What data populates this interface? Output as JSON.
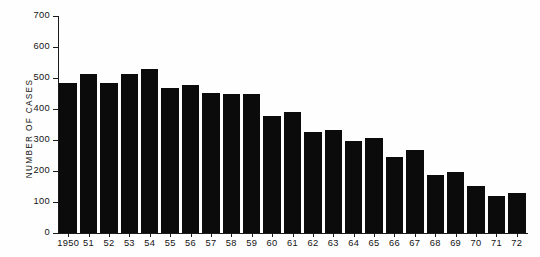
{
  "chart_data": {
    "type": "bar",
    "title": "",
    "subtitle": "",
    "xlabel": "",
    "ylabel": "NUMBER OF CASES",
    "ylim": [
      0,
      700
    ],
    "yticks": [
      0,
      100,
      200,
      300,
      400,
      500,
      600,
      700
    ],
    "ytick_labels": [
      "0",
      "100",
      "200",
      "300",
      "400",
      "500",
      "600",
      "700"
    ],
    "grid": false,
    "legend": null,
    "bar_color": "#0b0b0b",
    "axis_color": "#1a1a1a",
    "background_color": "#ffffff",
    "categories": [
      "1950",
      "51",
      "52",
      "53",
      "54",
      "55",
      "56",
      "57",
      "58",
      "59",
      "60",
      "61",
      "62",
      "63",
      "64",
      "65",
      "66",
      "67",
      "68",
      "69",
      "70",
      "71",
      "72"
    ],
    "values": [
      483,
      513,
      483,
      514,
      528,
      468,
      477,
      452,
      449,
      448,
      377,
      391,
      325,
      333,
      296,
      306,
      244,
      267,
      187,
      197,
      153,
      119,
      130
    ],
    "annotations": []
  }
}
